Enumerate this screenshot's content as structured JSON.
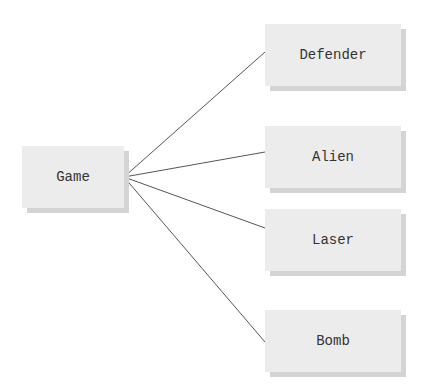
{
  "diagram": {
    "root": {
      "label": "Game",
      "x": 22,
      "y": 146,
      "w": 102,
      "h": 62
    },
    "children": [
      {
        "label": "Defender",
        "x": 265,
        "y": 24,
        "w": 136,
        "h": 62
      },
      {
        "label": "Alien",
        "x": 265,
        "y": 126,
        "w": 136,
        "h": 62
      },
      {
        "label": "Laser",
        "x": 265,
        "y": 209,
        "w": 136,
        "h": 62
      },
      {
        "label": "Bomb",
        "x": 265,
        "y": 310,
        "w": 136,
        "h": 62
      }
    ],
    "line_color": "#555555",
    "hub": {
      "x": 124,
      "y": 177
    }
  }
}
